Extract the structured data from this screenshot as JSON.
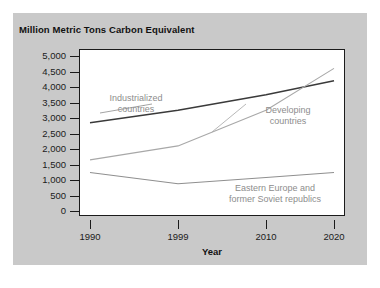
{
  "figure": {
    "title": "Million Metric Tons Carbon Equivalent",
    "xaxis_title": "Year",
    "panel_background": "#c9c9c9",
    "plot_background": "#ffffff",
    "frame_color": "#1b1b1b"
  },
  "chart_data": {
    "type": "line",
    "title": "Million Metric Tons Carbon Equivalent",
    "xlabel": "Year",
    "ylabel": "Million Metric Tons Carbon Equivalent",
    "x": [
      1990,
      1999,
      2010,
      2020
    ],
    "xtick_labels": [
      "1990",
      "1999",
      "2010",
      "2020"
    ],
    "ytick_labels": [
      "5,000",
      "4,500",
      "4,000",
      "3,500",
      "3,000",
      "2,500",
      "2,000",
      "1,500",
      "1,000",
      "500",
      "0"
    ],
    "ytick_values": [
      5000,
      4500,
      4000,
      3500,
      3000,
      2500,
      2000,
      1500,
      1000,
      500,
      0
    ],
    "ylim": [
      0,
      5000
    ],
    "xlim": [
      1990,
      2020
    ],
    "grid": false,
    "legend": "inline-annotations",
    "series": [
      {
        "name": "Industrialized countries",
        "label": "Industrialized\ncountries",
        "color": "#3a3a3a",
        "values": [
          2850,
          3250,
          3750,
          4200
        ]
      },
      {
        "name": "Developing countries",
        "label": "Developing\ncountries",
        "color": "#a8a8a8",
        "values": [
          1650,
          2100,
          3250,
          4600
        ]
      },
      {
        "name": "Eastern Europe and former Soviet republics",
        "label": "Eastern Europe and\nformer Soviet republics",
        "color": "#8f8f8f",
        "values": [
          1240,
          880,
          1080,
          1240
        ]
      }
    ]
  },
  "annotations": {
    "industrialized_line1": "Industrialized",
    "industrialized_line2": "countries",
    "developing_line1": "Developing",
    "developing_line2": "countries",
    "eastern_line1": "Eastern Europe and",
    "eastern_line2": "former Soviet republics"
  }
}
